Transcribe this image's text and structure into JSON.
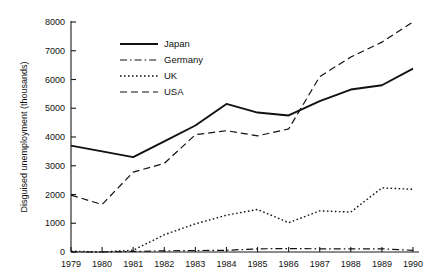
{
  "chart_data": {
    "type": "line",
    "title": "",
    "xlabel": "",
    "ylabel": "Disguised unemployment (thousands)",
    "x": [
      1979,
      1980,
      1981,
      1982,
      1983,
      1984,
      1985,
      1986,
      1987,
      1988,
      1989,
      1990
    ],
    "xtick_labels": [
      "1979",
      "1980",
      "1981",
      "1982",
      "1983",
      "1984",
      "1985",
      "1986",
      "1987",
      "1988",
      "1989",
      "1990"
    ],
    "ytick_labels": [
      "0",
      "1000",
      "2000",
      "3000",
      "4000",
      "5000",
      "6000",
      "7000",
      "8000"
    ],
    "ytick_values": [
      0,
      1000,
      2000,
      3000,
      4000,
      5000,
      6000,
      7000,
      8000
    ],
    "ylim": [
      0,
      8000
    ],
    "xlim": [
      1979,
      1990
    ],
    "grid": false,
    "legend_position": "upper-left-inside",
    "series": [
      {
        "name": "Japan",
        "style": "solid",
        "color": "#111111",
        "values": [
          3700,
          3500,
          3300,
          3850,
          4400,
          5150,
          4850,
          4750,
          5250,
          5650,
          5800,
          6380
        ]
      },
      {
        "name": "Germany",
        "style": "dash-dot",
        "color": "#111111",
        "values": [
          0,
          0,
          20,
          40,
          50,
          60,
          110,
          120,
          110,
          110,
          110,
          60
        ]
      },
      {
        "name": "UK",
        "style": "dotted",
        "color": "#111111",
        "values": [
          30,
          0,
          60,
          600,
          980,
          1280,
          1480,
          1020,
          1430,
          1390,
          2230,
          2180
        ]
      },
      {
        "name": "USA",
        "style": "dashed",
        "color": "#111111",
        "values": [
          1980,
          1650,
          2780,
          3080,
          4080,
          4220,
          4040,
          4280,
          6100,
          6780,
          7300,
          8000
        ]
      }
    ]
  }
}
